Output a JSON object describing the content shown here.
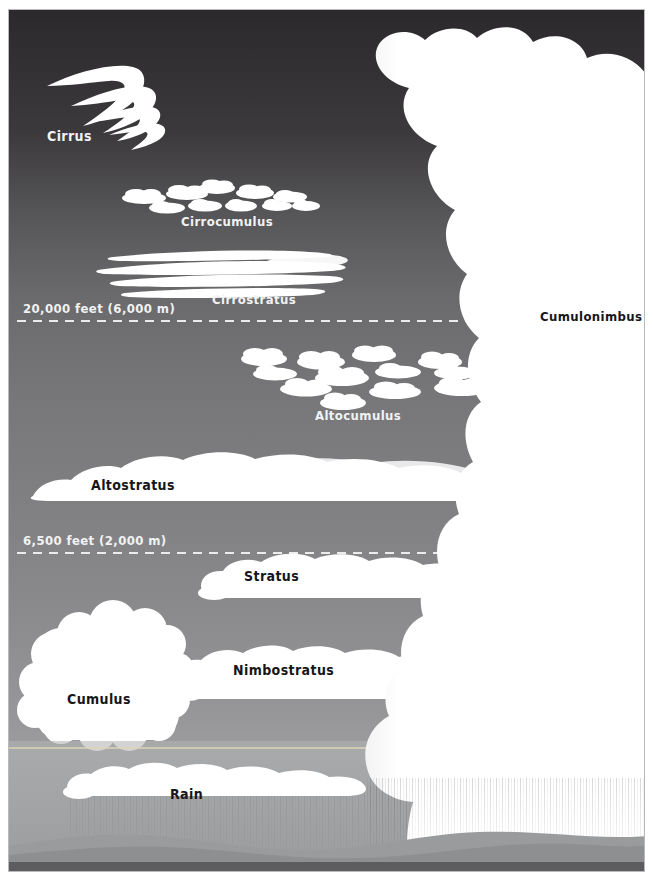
{
  "diagram": {
    "type": "cloud-classification-diagram",
    "width": 653,
    "height": 889,
    "colors": {
      "sky_top": "#2e2c2e",
      "sky_upper_mid": "#5b5a5c",
      "sky_mid": "#777779",
      "sky_lower": "#8e8e90",
      "haze_band": "#a6a7a9",
      "horizon_line": "#d8d6b8",
      "cloud_white": "#ffffff",
      "cloud_shadow": "#e4e4e6",
      "rain_streak": "#6f7173",
      "hill_far": "#9a9b9d",
      "hill_near": "#8a8b8d",
      "ground": "#5d5c5e",
      "label_dark": "#16161a",
      "label_light": "#f2f2f2",
      "frame": "#b9b9b9"
    }
  },
  "altitude_lines": [
    {
      "id": "upper-boundary",
      "label": "20,000 feet (6,000 m)",
      "feet": 20000,
      "meters": 6000,
      "y": 311,
      "style": "dashed"
    },
    {
      "id": "lower-boundary",
      "label": "6,500 feet (2,000 m)",
      "feet": 6500,
      "meters": 2000,
      "y": 543,
      "style": "dashed"
    }
  ],
  "cloud_labels": [
    {
      "id": "cirrus",
      "label": "Cirrus",
      "tier": "high",
      "x": 38,
      "y": 131,
      "anchor": "start",
      "tone": "light"
    },
    {
      "id": "cirrocumulus",
      "label": "Cirrocumulus",
      "tier": "high",
      "x": 172,
      "y": 216,
      "anchor": "start",
      "tone": "light"
    },
    {
      "id": "cirrostratus",
      "label": "Cirrostratus",
      "tier": "high",
      "x": 203,
      "y": 294,
      "anchor": "start",
      "tone": "light"
    },
    {
      "id": "cumulonimbus",
      "label": "Cumulonimbus",
      "tier": "all",
      "x": 531,
      "y": 311,
      "anchor": "start",
      "tone": "dark"
    },
    {
      "id": "altocumulus",
      "label": "Altocumulus",
      "tier": "middle",
      "x": 306,
      "y": 410,
      "anchor": "start",
      "tone": "light"
    },
    {
      "id": "altostratus",
      "label": "Altostratus",
      "tier": "middle",
      "x": 82,
      "y": 480,
      "anchor": "start",
      "tone": "dark"
    },
    {
      "id": "stratocumulus",
      "label": "Stratocumulus",
      "tier": "low",
      "x": 235,
      "y": 571,
      "anchor": "start",
      "tone": "dark"
    },
    {
      "id": "stratus",
      "label": "Stratus",
      "tier": "low",
      "x": 224,
      "y": 665,
      "anchor": "start",
      "tone": "dark"
    },
    {
      "id": "cumulus",
      "label": "Cumulus",
      "tier": "low",
      "x": 58,
      "y": 694,
      "anchor": "start",
      "tone": "dark"
    },
    {
      "id": "nimbostratus",
      "label": "Nimbostratus",
      "tier": "low",
      "x": 161,
      "y": 789,
      "anchor": "start",
      "tone": "dark"
    },
    {
      "id": "rain",
      "label": "Rain",
      "tier": "ground",
      "x": 470,
      "y": 801,
      "anchor": "start",
      "tone": "light"
    }
  ],
  "label_font_sizes": {
    "cirrus": 14,
    "cirrocumulus": 13,
    "cirrostratus": 13,
    "cumulonimbus": 13,
    "altocumulus": 13,
    "altostratus": 14,
    "stratocumulus": 14,
    "stratus": 14,
    "cumulus": 14,
    "nimbostratus": 14,
    "rain": 13
  }
}
